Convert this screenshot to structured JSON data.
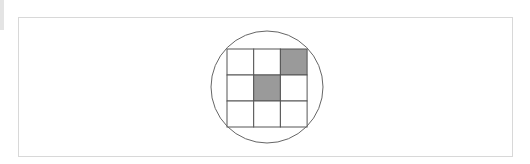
{
  "diagram": {
    "grid": {
      "rows": 3,
      "cols": 3,
      "shaded_cells": [
        [
          0,
          2
        ],
        [
          1,
          1
        ]
      ]
    },
    "colors": {
      "shaded": "#9a9a9a",
      "line": "#555555",
      "circle": "#666666",
      "frame": "#d8d8d8"
    }
  }
}
